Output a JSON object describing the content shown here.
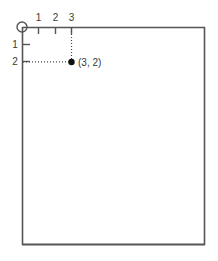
{
  "diagram": {
    "title": "",
    "frame": {
      "color": "#555555",
      "left": 22,
      "top": 27,
      "right": 205,
      "bottom": 245
    },
    "origin": {
      "marker": "origin-circle",
      "x": 22,
      "y": 27,
      "radius": 5,
      "color": "#555555"
    },
    "x_axis": {
      "name": "horizontal-axis",
      "direction": "right",
      "tick_labels": [
        "1",
        "2",
        "3"
      ],
      "tick_positions": [
        38,
        55,
        71
      ],
      "tick_length": 6,
      "label_y": 21,
      "color": "#555555"
    },
    "y_axis": {
      "name": "vertical-axis",
      "direction": "down",
      "tick_labels": [
        "1",
        "2"
      ],
      "tick_positions": [
        45,
        62
      ],
      "tick_length": 6,
      "label_x": 14,
      "color": "#555555"
    },
    "point": {
      "label": "(3, 2)",
      "x_value": 3,
      "y_value": 2,
      "px": 71,
      "py": 62,
      "radius": 3.2,
      "color": "#111111",
      "label_px": 78,
      "label_py": 66
    },
    "guides": {
      "color": "#4a4a4a",
      "dash": "1,2",
      "vertical": {
        "x": 71,
        "y1": 27,
        "y2": 62
      },
      "horizontal": {
        "y": 62,
        "x1": 22,
        "x2": 71
      }
    }
  }
}
